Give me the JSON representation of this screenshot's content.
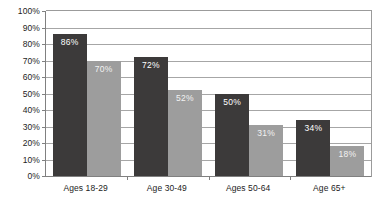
{
  "chart_data": {
    "type": "bar",
    "title": "",
    "xlabel": "",
    "ylabel": "",
    "ylim": [
      0,
      100
    ],
    "ytick_labels": [
      "100%",
      "90%",
      "80%",
      "70%",
      "60%",
      "50%",
      "40%",
      "30%",
      "20%",
      "10%",
      "0%"
    ],
    "ytick_values": [
      100,
      90,
      80,
      70,
      60,
      50,
      40,
      30,
      20,
      10,
      0
    ],
    "grid": true,
    "legend": "none",
    "categories": [
      "Ages 18-29",
      "Age 30-49",
      "Ages 50-64",
      "Age 65+"
    ],
    "series": [
      {
        "name": "series-1",
        "color": "#3c3a3a",
        "values": [
          86,
          72,
          50,
          34
        ],
        "labels": [
          "86%",
          "72%",
          "50%",
          "34%"
        ]
      },
      {
        "name": "series-2",
        "color": "#9d9d9d",
        "values": [
          70,
          52,
          31,
          18
        ],
        "labels": [
          "70%",
          "52%",
          "31%",
          "18%"
        ]
      }
    ]
  },
  "colors": {
    "background": "#ffffff",
    "axis": "#808080",
    "gridline": "#a6a6a6",
    "text": "#232323",
    "bar_dark": "#3c3a3a",
    "bar_light": "#9d9d9d",
    "bar_label_text": "#ffffff"
  }
}
